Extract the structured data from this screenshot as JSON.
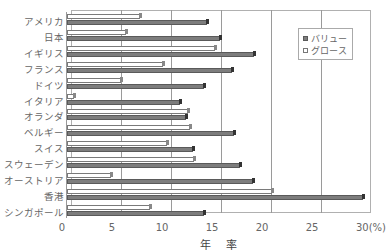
{
  "chart_data": {
    "type": "bar",
    "orientation": "horizontal",
    "title": "",
    "xlabel": "年 率",
    "ylabel": "",
    "x_unit": "(%)",
    "xlim": [
      0,
      30
    ],
    "x_ticks": [
      "0",
      "5",
      "10",
      "15",
      "20",
      "25",
      "30 (%)"
    ],
    "grid": true,
    "legend_position": "upper right inside",
    "categories": [
      "アメリカ",
      "日本",
      "イギリス",
      "フランス",
      "ドイツ",
      "イタリア",
      "オランダ",
      "ベルギー",
      "スイス",
      "スウェーデン",
      "オーストリア",
      "香港",
      "シンガポール"
    ],
    "series": [
      {
        "name": "バリュー",
        "color": "#7d7d7d",
        "values": [
          14.0,
          15.3,
          18.7,
          16.5,
          13.7,
          11.3,
          11.9,
          16.7,
          12.6,
          17.3,
          18.6,
          29.6,
          13.7
        ]
      },
      {
        "name": "グロース",
        "color": "#ffffff",
        "values": [
          7.3,
          5.9,
          14.8,
          9.6,
          5.4,
          0.7,
          12.1,
          12.3,
          10.0,
          12.7,
          4.4,
          20.5,
          8.3
        ]
      }
    ]
  },
  "legend": {
    "value_label": "バリュー",
    "growth_label": "グロース"
  },
  "axis": {
    "ticks": [
      "0",
      "5",
      "10",
      "15",
      "20",
      "25",
      "30(%)"
    ],
    "xlabel": "年 率"
  }
}
